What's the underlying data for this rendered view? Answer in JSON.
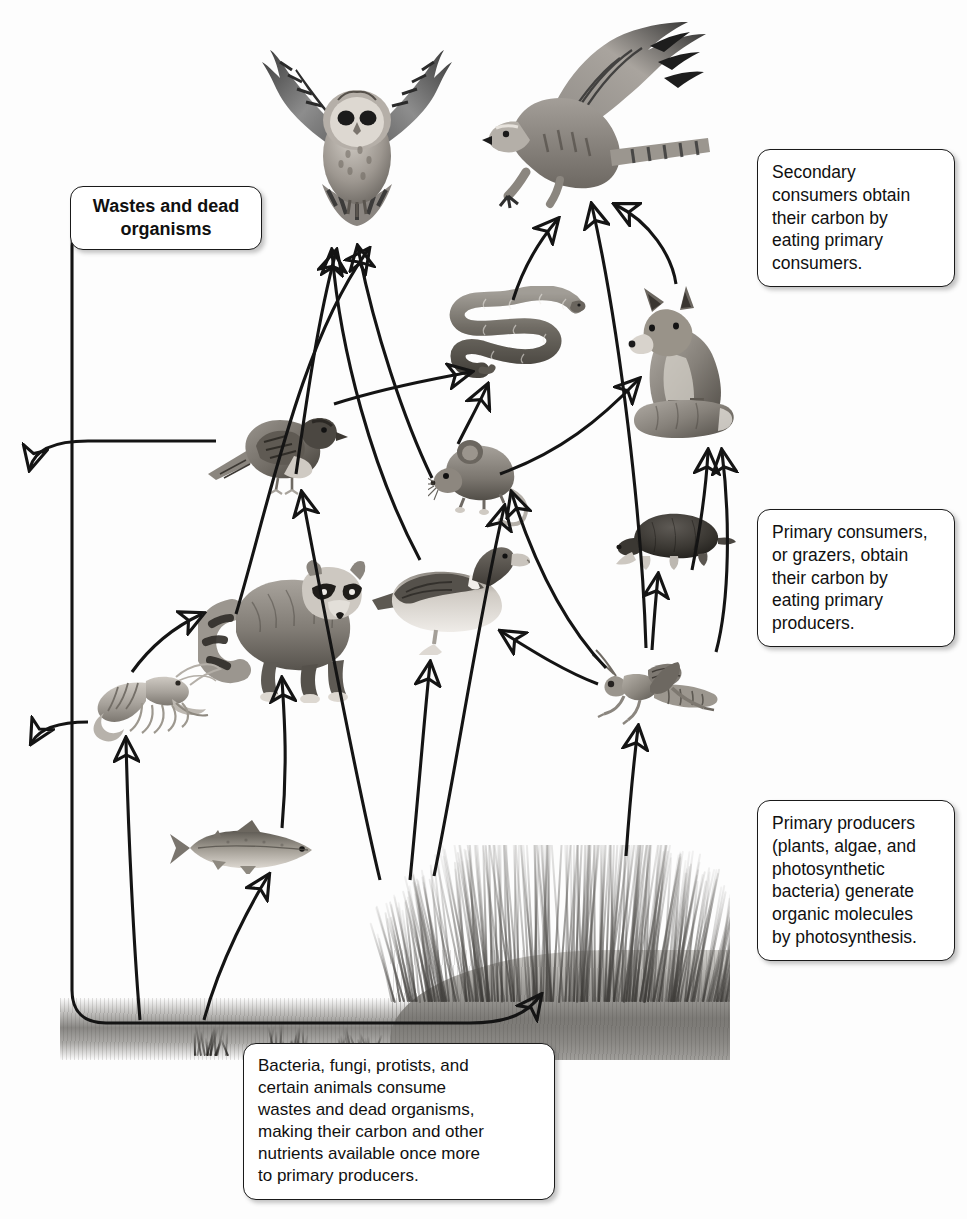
{
  "figure": {
    "type": "food-web-diagram",
    "background_color": "#ffffff",
    "line_color": "#141414"
  },
  "callouts": {
    "secondary_consumers": "Secondary\nconsumers obtain\ntheir carbon by\neating primary\nconsumers.",
    "primary_consumers": "Primary consumers,\nor grazers, obtain\ntheir carbon by\neating primary\nproducers.",
    "primary_producers": "Primary producers\n(plants, algae, and\nphotosynthetic\nbacteria) generate\norganic molecules\nby photosynthesis.",
    "decomposers": "Bacteria, fungi, protists, and\ncertain animals consume\nwastes and dead organisms,\nmaking their carbon and other\nnutrients available once more\nto primary producers.",
    "wastes": "Wastes and dead\norganisms"
  },
  "organisms": [
    {
      "id": "owl",
      "label": "Owl",
      "trophic_level": "secondary consumer",
      "x": 270,
      "y": 30
    },
    {
      "id": "hawk",
      "label": "Hawk",
      "trophic_level": "secondary consumer",
      "x": 480,
      "y": 14
    },
    {
      "id": "snake",
      "label": "Snake",
      "trophic_level": "secondary consumer",
      "x": 450,
      "y": 288
    },
    {
      "id": "fox",
      "label": "Fox",
      "trophic_level": "secondary consumer",
      "x": 628,
      "y": 282
    },
    {
      "id": "sparrow",
      "label": "Sparrow",
      "trophic_level": "primary consumer",
      "x": 212,
      "y": 408
    },
    {
      "id": "mouse",
      "label": "Mouse",
      "trophic_level": "primary consumer",
      "x": 432,
      "y": 434
    },
    {
      "id": "mole",
      "label": "Mole",
      "trophic_level": "primary consumer",
      "x": 612,
      "y": 505
    },
    {
      "id": "duck",
      "label": "Duck",
      "trophic_level": "primary consumer",
      "x": 378,
      "y": 533
    },
    {
      "id": "grasshopper",
      "label": "Grasshopper",
      "trophic_level": "primary consumer",
      "x": 596,
      "y": 651
    },
    {
      "id": "raccoon",
      "label": "Raccoon",
      "trophic_level": "primary consumer",
      "x": 205,
      "y": 562
    },
    {
      "id": "crayfish",
      "label": "Crayfish",
      "trophic_level": "primary consumer",
      "x": 78,
      "y": 660
    },
    {
      "id": "fish",
      "label": "Fish",
      "trophic_level": "primary consumer",
      "x": 175,
      "y": 823
    },
    {
      "id": "grass",
      "label": "Grass",
      "trophic_level": "primary producer",
      "x": 390,
      "y": 855
    },
    {
      "id": "soil",
      "label": "Soil and decomposers",
      "trophic_level": "decomposers",
      "x": 60,
      "y": 990
    }
  ],
  "feeding_links": [
    {
      "from": "grasshopper",
      "to": "duck"
    },
    {
      "from": "grasshopper",
      "to": "mouse"
    },
    {
      "from": "grasshopper",
      "to": "mole"
    },
    {
      "from": "grasshopper",
      "to": "fox"
    },
    {
      "from": "grasshopper",
      "to": "hawk"
    },
    {
      "from": "grass",
      "to": "grasshopper"
    },
    {
      "from": "grass",
      "to": "duck"
    },
    {
      "from": "grass",
      "to": "mouse"
    },
    {
      "from": "grass",
      "to": "sparrow"
    },
    {
      "from": "mouse",
      "to": "snake"
    },
    {
      "from": "mouse",
      "to": "fox"
    },
    {
      "from": "mouse",
      "to": "owl"
    },
    {
      "from": "sparrow",
      "to": "snake"
    },
    {
      "from": "sparrow",
      "to": "owl"
    },
    {
      "from": "snake",
      "to": "hawk"
    },
    {
      "from": "mole",
      "to": "fox"
    },
    {
      "from": "duck",
      "to": "owl"
    },
    {
      "from": "crayfish",
      "to": "raccoon"
    },
    {
      "from": "fish",
      "to": "raccoon"
    },
    {
      "from": "soil",
      "to": "crayfish"
    },
    {
      "from": "soil",
      "to": "fish"
    },
    {
      "from": "soil",
      "to": "grass"
    }
  ],
  "waste_links": [
    {
      "from": "sparrow",
      "to": "wastes"
    },
    {
      "from": "crayfish",
      "to": "wastes"
    },
    {
      "from": "wastes",
      "to": "soil"
    }
  ]
}
